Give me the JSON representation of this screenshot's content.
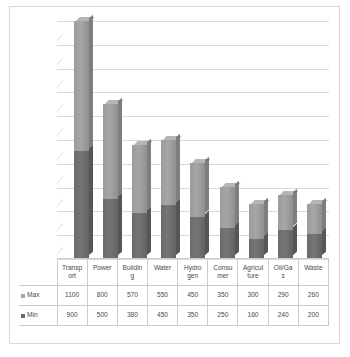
{
  "chart_data": {
    "type": "bar",
    "subtype": "3d-stacked-column",
    "title": "",
    "subtitle": "",
    "xlabel": "",
    "ylabel": "",
    "ylim": [
      0,
      2000
    ],
    "ytick_step": 200,
    "yticks": [
      0,
      200,
      400,
      600,
      800,
      1000,
      1200,
      1400,
      1600,
      1800,
      2000
    ],
    "y_tick_labels_visible": false,
    "grid": true,
    "legend_position": "data-table-left",
    "stacked": true,
    "stack_order": [
      "Min",
      "Max"
    ],
    "categories": [
      "Transport",
      "Power",
      "Building",
      "Water",
      "Hydrogen",
      "Consumer",
      "Agriculture",
      "Oil/Gas",
      "Waste"
    ],
    "category_labels_wrapped": [
      [
        "Transp",
        "ort"
      ],
      [
        "Power",
        ""
      ],
      [
        "Buildin",
        "g"
      ],
      [
        "Water",
        ""
      ],
      [
        "Hydro",
        "gen"
      ],
      [
        "Consu",
        "mer"
      ],
      [
        "Agricul",
        "ture"
      ],
      [
        "Oil/Ga",
        "s"
      ],
      [
        "Waste",
        ""
      ]
    ],
    "series": [
      {
        "name": "Max",
        "color": "#a6a6a6",
        "values": [
          1100,
          800,
          570,
          550,
          450,
          350,
          300,
          290,
          260
        ]
      },
      {
        "name": "Min",
        "color": "#6b6b6b",
        "values": [
          900,
          500,
          380,
          450,
          350,
          250,
          160,
          240,
          200
        ]
      }
    ],
    "stack_totals": [
      2000,
      1300,
      950,
      1000,
      800,
      600,
      460,
      530,
      460
    ]
  },
  "table": {
    "row_labels": [
      "Max",
      "Min"
    ],
    "rows": [
      {
        "label": "Max",
        "swatch": "swatch-max",
        "values": [
          "1100",
          "800",
          "570",
          "550",
          "450",
          "350",
          "300",
          "290",
          "260"
        ]
      },
      {
        "label": "Min",
        "swatch": "swatch-min",
        "values": [
          "900",
          "500",
          "380",
          "450",
          "350",
          "250",
          "160",
          "240",
          "200"
        ]
      }
    ]
  },
  "colors": {
    "series_max": "#a6a6a6",
    "series_min": "#6b6b6b",
    "gridline": "#d6d9dd",
    "border": "#d9d9d9",
    "table_border": "#c8ccd0",
    "text": "#4a4a4a",
    "background": "#ffffff"
  }
}
